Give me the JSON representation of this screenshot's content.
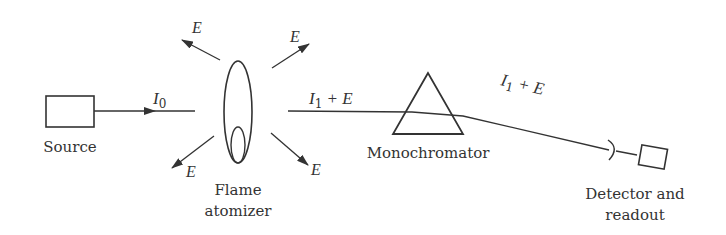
{
  "diagram": {
    "type": "block-diagram",
    "components": [
      {
        "id": "source",
        "label": "Source"
      },
      {
        "id": "flame",
        "label_line1": "Flame",
        "label_line2": "atomizer"
      },
      {
        "id": "monochromator",
        "label": "Monochromator"
      },
      {
        "id": "detector",
        "label_line1": "Detector and",
        "label_line2": "readout"
      }
    ],
    "beams": {
      "incident": {
        "symbol": "I",
        "subscript": "0"
      },
      "transmitted": {
        "symbol": "I",
        "subscript": "1",
        "suffix": " + E"
      },
      "transmitted_after_mono": {
        "symbol": "I",
        "subscript": "1",
        "suffix": " + E"
      }
    },
    "emission_label": "E",
    "colors": {
      "line": "#333333",
      "background": "#ffffff"
    }
  }
}
